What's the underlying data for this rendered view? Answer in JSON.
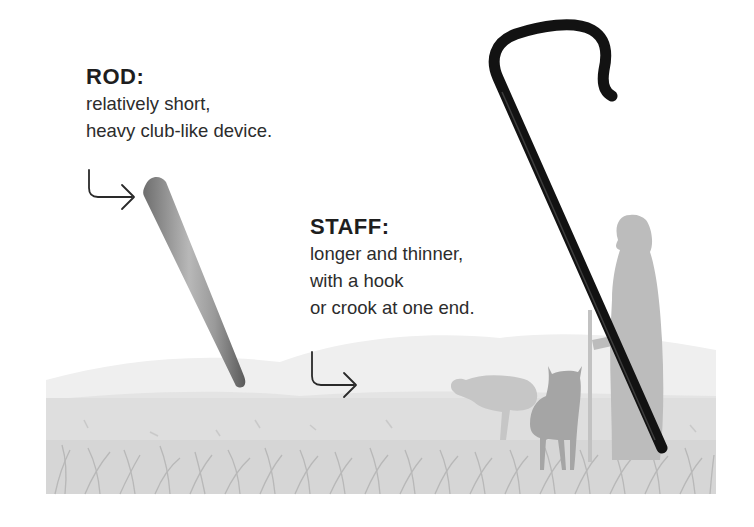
{
  "rod": {
    "title": "ROD:",
    "lines": [
      "relatively short,",
      "heavy club-like device."
    ]
  },
  "staff": {
    "title": "STAFF:",
    "lines": [
      "longer and thinner,",
      "with a hook",
      "or crook at one end."
    ]
  },
  "icons": {
    "rod_arrow": "arrow-down-right-icon",
    "staff_arrow": "arrow-down-right-icon"
  },
  "colors": {
    "background": "#ffffff",
    "text": "#2a2a2a",
    "staff": "#111111",
    "rod": "#8c8c8c",
    "meadow": "#dcdcdc",
    "hill": "#ebebeb",
    "silhouette_light": "#bdbdbd",
    "silhouette_dark": "#9a9a9a"
  }
}
